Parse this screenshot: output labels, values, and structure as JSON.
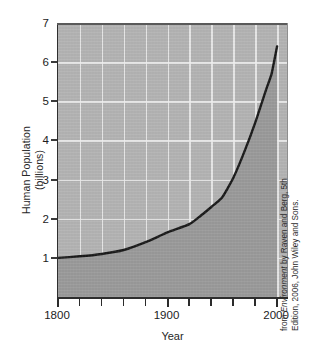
{
  "chart_data": {
    "type": "line",
    "title": "",
    "subtitle": "",
    "xlabel": "Year",
    "ylabel_line1": "Human Population",
    "ylabel_line2": "(billions)",
    "ylabel_full": "Human Population (billions)",
    "xlim": [
      1800,
      2010
    ],
    "ylim": [
      0,
      7
    ],
    "x_tick_labels": [
      "1800",
      "1900",
      "2000"
    ],
    "x_major_ticks": [
      1800,
      1900,
      2000
    ],
    "x_minor_ticks": [
      1820,
      1840,
      1860,
      1880,
      1920,
      1940,
      1960,
      1980
    ],
    "y_tick_labels": [
      "1",
      "2",
      "3",
      "4",
      "5",
      "6",
      "7"
    ],
    "y_ticks": [
      1,
      2,
      3,
      4,
      5,
      6,
      7
    ],
    "grid": "white gridlines, vertical every 20 years, horizontal at every integer billion",
    "legend": "none",
    "legend_position": "none",
    "fill": "area under curve shaded darker gray",
    "series": [
      {
        "name": "Human Population (billions)",
        "x": [
          1800,
          1820,
          1840,
          1860,
          1880,
          1900,
          1920,
          1930,
          1940,
          1950,
          1960,
          1970,
          1980,
          1990,
          1995,
          2000
        ],
        "values": [
          1.0,
          1.04,
          1.1,
          1.2,
          1.4,
          1.65,
          1.86,
          2.07,
          2.3,
          2.55,
          3.04,
          3.7,
          4.45,
          5.3,
          5.7,
          6.4
        ]
      }
    ],
    "annotations": [
      "Curve begins at about 1 billion in 1800 and rises exponentially to about 6.4 billion in 2000."
    ],
    "colors": {
      "curve": "#1a1a1a",
      "area_below_curve": "#9a9a9a",
      "area_above_curve": "#bcbcbc",
      "gridline": "#f0f0f0",
      "axis": "#2e2e2e",
      "text": "#1c1c1c",
      "background": "#ffffff"
    }
  },
  "credit": {
    "line1_prefix": "from ",
    "line1_italic": "Environment",
    "line1_suffix": " by Raven and Berg, 5th",
    "line2": "Edition, 2006, John Wiley and Sons."
  }
}
